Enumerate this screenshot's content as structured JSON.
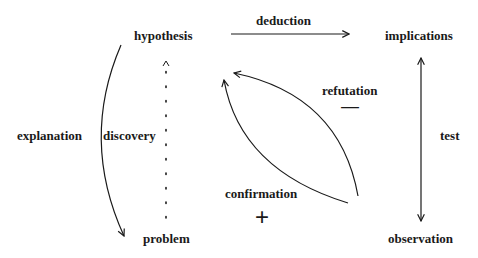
{
  "diagram": {
    "nodes": {
      "hypothesis": "hypothesis",
      "implications": "implications",
      "problem": "problem",
      "observation": "observation"
    },
    "edges": {
      "deduction": {
        "label": "deduction",
        "from": "hypothesis",
        "to": "implications"
      },
      "test": {
        "label": "test",
        "from": "implications",
        "to": "observation",
        "bidirectional": true
      },
      "explanation": {
        "label": "explanation",
        "from": "hypothesis",
        "to": "problem"
      },
      "discovery": {
        "label": "discovery",
        "from": "problem",
        "to": "hypothesis",
        "style": "dotted"
      },
      "refutation": {
        "label": "refutation",
        "sign": "—",
        "from": "observation",
        "to": "hypothesis"
      },
      "confirmation": {
        "label": "confirmation",
        "sign": "+",
        "from": "observation",
        "to": "hypothesis"
      }
    },
    "colors": {
      "ink": "#1a1a1a",
      "background": "#ffffff"
    }
  }
}
